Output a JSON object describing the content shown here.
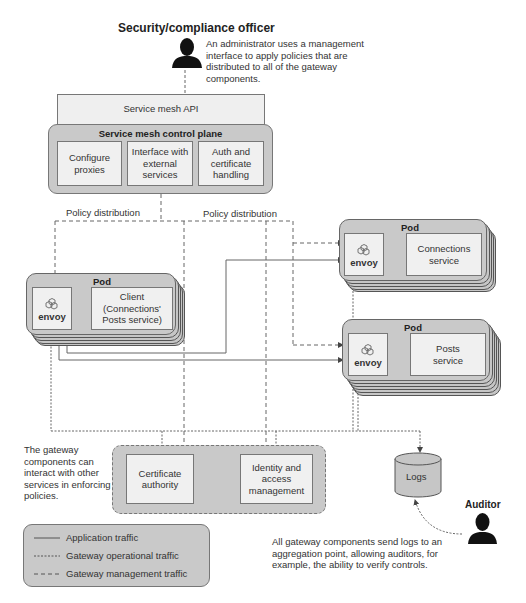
{
  "officer": {
    "title": "Security/compliance officer",
    "description": [
      "An administrator uses a management",
      "interface to apply policies that are",
      "distributed to all of the gateway",
      "components."
    ]
  },
  "api": {
    "label": "Service mesh API"
  },
  "control_plane": {
    "title": "Service mesh control plane",
    "components": [
      {
        "lines": [
          "Configure",
          "proxies"
        ]
      },
      {
        "lines": [
          "Interface with",
          "external",
          "services"
        ]
      },
      {
        "lines": [
          "Auth and",
          "certificate",
          "handling"
        ]
      }
    ]
  },
  "policy_labels": [
    "Policy distribution",
    "Policy distribution"
  ],
  "pods": [
    {
      "label": "Pod",
      "envoy": "envoy",
      "service_lines": [
        "Client",
        "(Connections'",
        "Posts service)"
      ]
    },
    {
      "label": "Pod",
      "envoy": "envoy",
      "service_lines": [
        "Connections",
        "service"
      ]
    },
    {
      "label": "Pod",
      "envoy": "envoy",
      "service_lines": [
        "Posts",
        "service"
      ]
    }
  ],
  "gateway_note": [
    "The gateway",
    "components can",
    "interact with other",
    "services in enforcing",
    "policies."
  ],
  "external_services": [
    {
      "lines": [
        "Certificate",
        "authority"
      ]
    },
    {
      "lines": [
        "Identity and",
        "access",
        "management"
      ]
    }
  ],
  "logs": {
    "label": "Logs"
  },
  "auditor": {
    "title": "Auditor",
    "description": [
      "All gateway components send logs to an",
      "aggregation point, allowing auditors, for",
      "example, the ability to verify controls."
    ]
  },
  "legend": {
    "items": [
      {
        "style": "solid",
        "label": "Application traffic"
      },
      {
        "style": "dotted",
        "label": "Gateway operational traffic"
      },
      {
        "style": "dashed",
        "label": "Gateway management traffic"
      }
    ]
  },
  "colors": {
    "panel": "#c9c9c9",
    "box": "#f0f0f0",
    "line": "#555555",
    "text": "#333333"
  }
}
